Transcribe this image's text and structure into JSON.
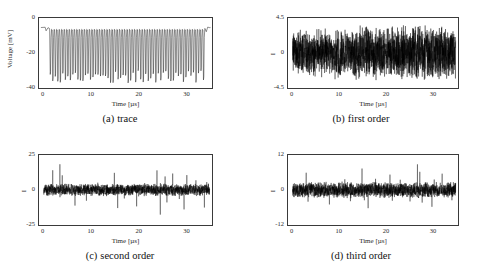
{
  "figure": {
    "panels": [
      {
        "key": "a",
        "tag": "(a)",
        "caption": "trace",
        "xlabel": "Time [µs]",
        "ylabel": "Voltage [mV]",
        "ylabel_style": "long",
        "xticks": [
          "0",
          "10",
          "20",
          "30"
        ],
        "xtick_values": [
          0,
          10,
          20,
          30
        ],
        "yticks": [
          "0",
          "-20",
          "-40"
        ],
        "ytick_values": [
          0,
          -20,
          -40
        ]
      },
      {
        "key": "b",
        "tag": "(b)",
        "caption": "first order",
        "xlabel": "Time [µs]",
        "ylabel": "I",
        "ylabel_style": "short",
        "xticks": [
          "0",
          "10",
          "20",
          "30"
        ],
        "xtick_values": [
          0,
          10,
          20,
          30
        ],
        "yticks": [
          "4.5",
          "0",
          "-4.5"
        ],
        "ytick_values": [
          4.5,
          0,
          -4.5
        ]
      },
      {
        "key": "c",
        "tag": "(c)",
        "caption": "second order",
        "xlabel": "Time [µs]",
        "ylabel": "I",
        "ylabel_style": "short",
        "xticks": [
          "0",
          "10",
          "20",
          "30"
        ],
        "xtick_values": [
          0,
          10,
          20,
          30
        ],
        "yticks": [
          "25",
          "0",
          "-25"
        ],
        "ytick_values": [
          25,
          0,
          -25
        ]
      },
      {
        "key": "d",
        "tag": "(d)",
        "caption": "third order",
        "xlabel": "Time [µs]",
        "ylabel": "I",
        "ylabel_style": "short",
        "xticks": [
          "0",
          "10",
          "20",
          "30"
        ],
        "xtick_values": [
          0,
          10,
          20,
          30
        ],
        "yticks": [
          "12",
          "0",
          "-12"
        ],
        "ytick_values": [
          12,
          0,
          -12
        ]
      }
    ]
  },
  "chart_data": [
    {
      "type": "line",
      "panel": "a",
      "title": "(a) trace",
      "xlabel": "Time [µs]",
      "ylabel": "Voltage [mV]",
      "xlim": [
        -1.0,
        35.5
      ],
      "ylim": [
        -44.0,
        3.0
      ],
      "xticks": [
        0,
        10,
        20,
        30
      ],
      "yticks": [
        0,
        -20,
        -40
      ],
      "grid": false,
      "legend": null,
      "series": [
        {
          "name": "voltage trace",
          "description": "Periodic negative-going pulse train: flat baseline near -4 mV with ~62 sharp downward spikes between t=1.2 and t=33.8 us, spike depth mostly -32 to -41 mV, pulse period about 0.53 us; short flat saturated segments at both ends of the record.",
          "baseline": -4.0,
          "pulse_count": 62,
          "pulse_period_us": 0.53,
          "pulse_start_us": 1.2,
          "pulse_end_us": 33.8,
          "pulse_min_depth_mV": -41.0,
          "pulse_max_depth_mV": -32.0
        }
      ]
    },
    {
      "type": "line",
      "panel": "b",
      "title": "(b) first order",
      "xlabel": "Time [µs]",
      "ylabel": "I",
      "xlim": [
        -1.0,
        35.5
      ],
      "ylim": [
        -5.6,
        5.6
      ],
      "xticks": [
        0,
        10,
        20,
        30
      ],
      "yticks": [
        4.5,
        0,
        -4.5
      ],
      "grid": false,
      "legend": null,
      "series": [
        {
          "name": "first order difference",
          "description": "Dense zero-mean noise band filling roughly -3 to +3 with envelope growing slightly after t=14; a few excursions reach +4.4 near t=14.5 and t=27.",
          "mean": 0.0,
          "typical_envelope": [
            -3.0,
            3.0
          ],
          "peak_max": 4.4,
          "peak_min": -4.2
        }
      ]
    },
    {
      "type": "line",
      "panel": "c",
      "title": "(c) second order",
      "xlabel": "Time [µs]",
      "ylabel": "I",
      "xlim": [
        -1.0,
        35.5
      ],
      "ylim": [
        -31.0,
        31.0
      ],
      "xticks": [
        0,
        10,
        20,
        30
      ],
      "yticks": [
        25,
        0,
        -25
      ],
      "grid": false,
      "legend": null,
      "series": [
        {
          "name": "second order difference",
          "description": "Low-amplitude noise band about -4 to +4 with sparse large impulsive spikes; positive spikes near t=2, 3.5, 15, 24, 27, 30 reaching +17 to +23 and negative spikes near t=6.5, 15.5, 19.5, 24.5, 29.5, 34 reaching -14 to -22.",
          "mean": 0.0,
          "typical_envelope": [
            -4.0,
            4.0
          ],
          "peak_max": 23.0,
          "peak_min": -22.0
        }
      ]
    },
    {
      "type": "line",
      "panel": "d",
      "title": "(d) third order",
      "xlabel": "Time [µs]",
      "ylabel": "I",
      "xlim": [
        -1.0,
        35.5
      ],
      "ylim": [
        -15.0,
        15.0
      ],
      "xticks": [
        0,
        10,
        20,
        30
      ],
      "yticks": [
        12,
        0,
        -12
      ],
      "grid": false,
      "legend": null,
      "series": [
        {
          "name": "third order difference",
          "description": "Noise band roughly -2.5 to +2.5 with intermittent bursts; notable positive spikes near t=3, 15, 21, 27, 32 reaching +7 to +11 and negative spikes near t=8, 16, 30 reaching -6 to -8.",
          "mean": 0.0,
          "typical_envelope": [
            -2.5,
            2.5
          ],
          "peak_max": 11.0,
          "peak_min": -8.0
        }
      ]
    }
  ]
}
